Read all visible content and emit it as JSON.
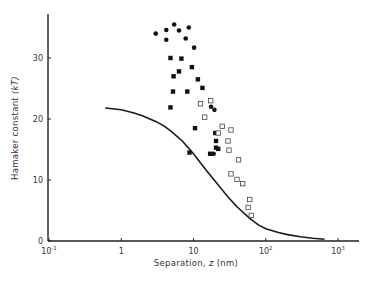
{
  "chart_data": {
    "type": "scatter",
    "title": "",
    "xlabel": "Separation, z (nm)",
    "ylabel": "Hamaker constant (kT)",
    "x_scale": "log",
    "xlim": [
      0.1,
      1500
    ],
    "ylim": [
      0,
      37
    ],
    "grid": false,
    "legend": null,
    "x_ticks": [
      {
        "value": 0.1,
        "label_base": "10",
        "label_exp": "-1"
      },
      {
        "value": 1,
        "label_base": "1",
        "label_exp": ""
      },
      {
        "value": 10,
        "label_base": "10",
        "label_exp": ""
      },
      {
        "value": 100,
        "label_base": "10",
        "label_exp": "2"
      },
      {
        "value": 1000,
        "label_base": "10",
        "label_exp": "3"
      }
    ],
    "y_ticks": [
      0,
      10,
      20,
      30
    ],
    "series": [
      {
        "name": "filled circles",
        "marker": "circle-filled",
        "points": [
          [
            3.0,
            34.0
          ],
          [
            4.2,
            34.6
          ],
          [
            5.4,
            35.5
          ],
          [
            6.3,
            34.5
          ],
          [
            8.6,
            35.0
          ],
          [
            4.2,
            33.0
          ],
          [
            7.8,
            33.2
          ],
          [
            10.2,
            31.7
          ],
          [
            17.5,
            22.0
          ],
          [
            19.5,
            21.5
          ],
          [
            19.0,
            14.3
          ]
        ]
      },
      {
        "name": "filled squares",
        "marker": "square-filled",
        "points": [
          [
            4.8,
            30.0
          ],
          [
            6.8,
            29.9
          ],
          [
            5.3,
            27.0
          ],
          [
            6.3,
            27.8
          ],
          [
            9.5,
            28.5
          ],
          [
            5.2,
            24.5
          ],
          [
            8.2,
            24.5
          ],
          [
            11.5,
            26.5
          ],
          [
            13.3,
            25.1
          ],
          [
            4.8,
            21.9
          ],
          [
            10.5,
            18.5
          ],
          [
            20.0,
            17.7
          ],
          [
            20.5,
            16.4
          ],
          [
            20.5,
            15.3
          ],
          [
            8.8,
            14.5
          ],
          [
            17.0,
            14.3
          ],
          [
            22.0,
            15.1
          ]
        ]
      },
      {
        "name": "open squares",
        "marker": "square-open",
        "points": [
          [
            12.5,
            22.5
          ],
          [
            17.3,
            23.0
          ],
          [
            14.3,
            20.3
          ],
          [
            25.0,
            18.8
          ],
          [
            22.0,
            17.7
          ],
          [
            33.0,
            18.2
          ],
          [
            30.0,
            16.4
          ],
          [
            31.0,
            14.9
          ],
          [
            42.0,
            13.3
          ],
          [
            33.0,
            11.0
          ],
          [
            40.0,
            10.1
          ],
          [
            48.0,
            9.4
          ],
          [
            60.0,
            6.8
          ],
          [
            57.0,
            5.5
          ],
          [
            63.0,
            4.2
          ]
        ]
      },
      {
        "name": "theory curve",
        "marker": "line",
        "points": [
          [
            0.6,
            21.8
          ],
          [
            1.0,
            21.5
          ],
          [
            1.5,
            21.0
          ],
          [
            2.0,
            20.5
          ],
          [
            3.0,
            19.6
          ],
          [
            4.0,
            18.8
          ],
          [
            5.0,
            17.9
          ],
          [
            7.0,
            16.4
          ],
          [
            10.0,
            14.3
          ],
          [
            15.0,
            11.6
          ],
          [
            20.0,
            9.8
          ],
          [
            30.0,
            7.2
          ],
          [
            40.0,
            5.6
          ],
          [
            60.0,
            3.7
          ],
          [
            80.0,
            2.6
          ],
          [
            100.0,
            2.0
          ],
          [
            150.0,
            1.4
          ],
          [
            200.0,
            1.05
          ],
          [
            300.0,
            0.7
          ],
          [
            450.0,
            0.45
          ],
          [
            650.0,
            0.3
          ]
        ]
      }
    ]
  },
  "labels": {
    "ylabel_main": "Hamaker constant ",
    "ylabel_unit": "(kT)",
    "xlabel_main": "Separation, ",
    "xlabel_var": "z",
    "xlabel_unit": " (nm)"
  }
}
